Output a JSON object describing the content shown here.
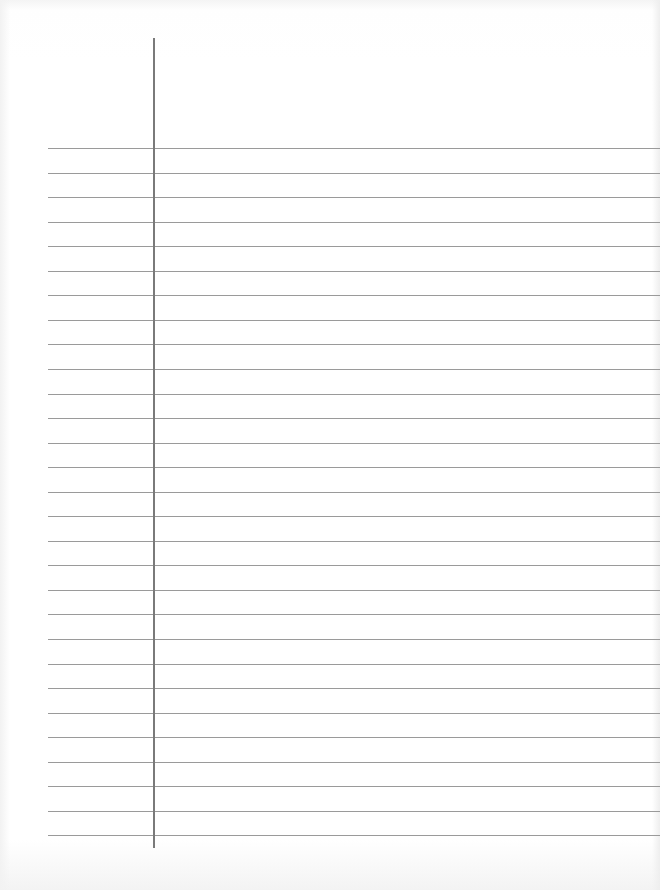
{
  "paper": {
    "type": "lined",
    "background_color": "#ffffff",
    "rule_color": "#9a9a9a",
    "margin_line_color": "#7a7a7a",
    "rule_count": 29,
    "first_rule_y": 148,
    "rule_spacing": 24.55,
    "rule_left_x": 48,
    "margin_line_x": 153,
    "margin_line_top": 38,
    "margin_line_bottom": 848
  }
}
